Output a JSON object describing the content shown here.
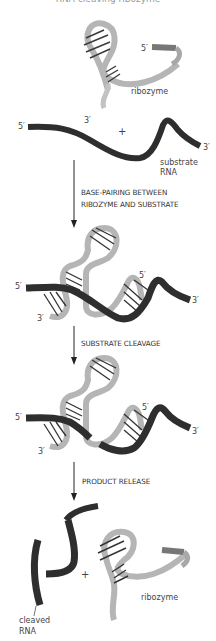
{
  "figure": {
    "title_fragment": "RNA-cleaving ribozyme",
    "colors": {
      "ribozyme": "#b5b5b5",
      "ribozyme_dark": "#8a8a8a",
      "substrate": "#2e2e2e",
      "base_pair": "#333333",
      "arrow": "#222222"
    }
  },
  "stage1": {
    "ribozyme_label": "ribozyme",
    "ribozyme_5prime": "5′",
    "ribozyme_3prime": "3′",
    "plus": "+",
    "substrate_5prime": "5′",
    "substrate_3prime": "3′",
    "substrate_label_line1": "substrate",
    "substrate_label_line2": "RNA"
  },
  "step1": {
    "line1": "BASE-PAIRING BETWEEN",
    "line2": "RIBOZYME AND SUBSTRATE"
  },
  "stage2": {
    "left_5prime": "5′",
    "left_3prime": "3′",
    "inner_5prime": "5′",
    "right_3prime": "3′"
  },
  "step2": {
    "line1": "SUBSTRATE CLEAVAGE"
  },
  "stage3": {
    "left_5prime": "5′",
    "left_3prime": "3′",
    "inner_5prime": "5′",
    "right_3prime": "3′"
  },
  "step3": {
    "line1": "PRODUCT RELEASE"
  },
  "stage4": {
    "plus": "+",
    "ribozyme_label": "ribozyme",
    "cleaved_label_line1": "cleaved",
    "cleaved_label_line2": "RNA"
  }
}
